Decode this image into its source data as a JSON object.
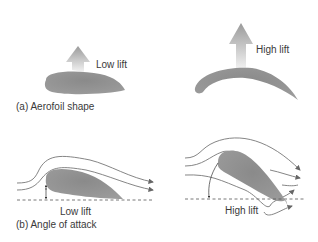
{
  "panel_a": {
    "caption": "(a) Aerofoil shape",
    "low_lift_label": "Low lift",
    "high_lift_label": "High lift"
  },
  "panel_b": {
    "caption": "(b) Angle of attack",
    "low_lift_label": "Low lift",
    "high_lift_label": "High lift"
  },
  "colors": {
    "aerofoil_fill": "#8c8c8c",
    "streamline": "#777777",
    "lift_arrow_top": "#9a9a9a",
    "lift_arrow_bottom": "#f2f2f2"
  }
}
